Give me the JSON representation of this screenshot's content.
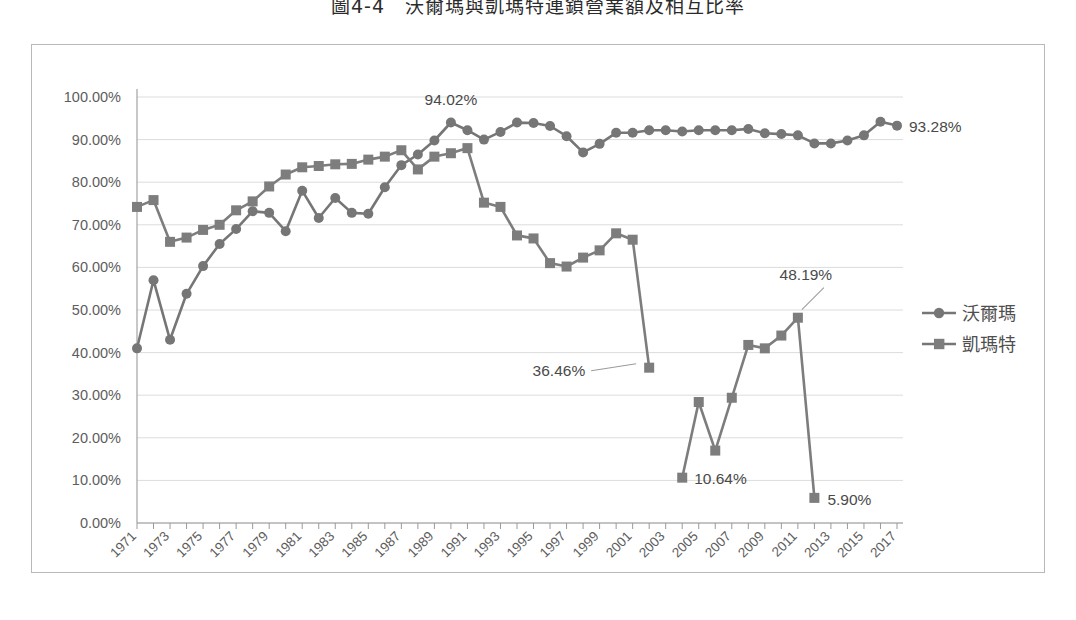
{
  "page": {
    "title": "圖4-4　沃爾瑪與凱瑪特連鎖營業額及相互比率"
  },
  "legend": {
    "position": "right",
    "items": [
      {
        "label": "沃爾瑪",
        "marker": "circle-marker",
        "color": "#767676"
      },
      {
        "label": "凱瑪特",
        "marker": "square-marker",
        "color": "#7d7d7d"
      }
    ]
  },
  "annotations": [
    {
      "name": "annotation-walmart-peak",
      "text": "94.02%",
      "x": 1990,
      "y": 94.02
    },
    {
      "name": "annotation-walmart-end",
      "text": "93.28%",
      "x": 2017,
      "y": 93.28
    },
    {
      "name": "annotation-kmart-2002",
      "text": "36.46%",
      "x": 2002,
      "y": 36.46
    },
    {
      "name": "annotation-kmart-2004",
      "text": "10.64%",
      "x": 2004,
      "y": 10.64
    },
    {
      "name": "annotation-kmart-2011",
      "text": "48.19%",
      "x": 2011,
      "y": 48.19
    },
    {
      "name": "annotation-kmart-2012",
      "text": "5.90%",
      "x": 2012,
      "y": 5.9
    }
  ],
  "chart_data": {
    "type": "line",
    "title": "圖4-4　沃爾瑪與凱瑪特連鎖營業額及相互比率",
    "xlabel": "",
    "ylabel": "",
    "xlim": [
      1971,
      2017
    ],
    "ylim": [
      0,
      100
    ],
    "ytick_labels": [
      "0.00%",
      "10.00%",
      "20.00%",
      "30.00%",
      "40.00%",
      "50.00%",
      "60.00%",
      "70.00%",
      "80.00%",
      "90.00%",
      "100.00%"
    ],
    "ytick_values": [
      0,
      10,
      20,
      30,
      40,
      50,
      60,
      70,
      80,
      90,
      100
    ],
    "xtick_labels": [
      "1971",
      "1973",
      "1975",
      "1977",
      "1979",
      "1981",
      "1983",
      "1985",
      "1987",
      "1989",
      "1991",
      "1993",
      "1995",
      "1997",
      "1999",
      "2001",
      "2003",
      "2005",
      "2007",
      "2009",
      "2011",
      "2013",
      "2015",
      "2017"
    ],
    "x": [
      1971,
      1972,
      1973,
      1974,
      1975,
      1976,
      1977,
      1978,
      1979,
      1980,
      1981,
      1982,
      1983,
      1984,
      1985,
      1986,
      1987,
      1988,
      1989,
      1990,
      1991,
      1992,
      1993,
      1994,
      1995,
      1996,
      1997,
      1998,
      1999,
      2000,
      2001,
      2002,
      2003,
      2004,
      2005,
      2006,
      2007,
      2008,
      2009,
      2010,
      2011,
      2012,
      2013,
      2014,
      2015,
      2016,
      2017
    ],
    "grid": "horizontal",
    "legend_position": "right",
    "series": [
      {
        "name": "沃爾瑪",
        "marker": "circle",
        "color": "#767676",
        "values": [
          41.0,
          57.0,
          43.0,
          53.8,
          60.3,
          65.5,
          69.0,
          73.2,
          72.8,
          68.5,
          78.0,
          71.6,
          76.3,
          72.8,
          72.6,
          78.8,
          84.0,
          86.5,
          89.8,
          94.02,
          92.2,
          90.0,
          91.8,
          94.0,
          93.9,
          93.2,
          90.8,
          87.0,
          89.0,
          91.6,
          91.6,
          92.2,
          92.2,
          91.9,
          92.2,
          92.2,
          92.2,
          92.5,
          91.5,
          91.3,
          91.0,
          89.1,
          89.1,
          89.8,
          91.0,
          94.2,
          93.28
        ]
      },
      {
        "name": "凱瑪特",
        "marker": "square",
        "color": "#7d7d7d",
        "values": [
          74.2,
          75.8,
          66.0,
          67.0,
          68.8,
          70.0,
          73.4,
          75.5,
          79.0,
          81.8,
          83.5,
          83.8,
          84.2,
          84.3,
          85.3,
          86.0,
          87.5,
          83.0,
          86.0,
          86.8,
          88.0,
          75.2,
          74.2,
          67.5,
          66.8,
          61.0,
          60.2,
          62.3,
          64.0,
          68.0,
          66.5,
          36.46,
          null,
          10.64,
          28.4,
          17.0,
          29.4,
          41.8,
          41.0,
          44.0,
          48.19,
          5.9,
          null,
          null,
          null,
          null,
          null
        ]
      }
    ]
  }
}
